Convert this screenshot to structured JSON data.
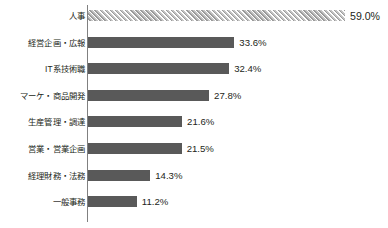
{
  "chart_data": {
    "type": "bar",
    "orientation": "horizontal",
    "title": "",
    "subtitle": "",
    "xlabel": "",
    "ylabel": "",
    "xlim": [
      0,
      59.0
    ],
    "grid": false,
    "legend": null,
    "categories": [
      "人事",
      "経営企画・広報",
      "IT系技術職",
      "マーケ・商品開発",
      "生産管理・調達",
      "営業・営業企画",
      "経理財務・法務",
      "一般事務"
    ],
    "values": [
      59.0,
      33.6,
      32.4,
      27.8,
      21.6,
      21.5,
      14.3,
      11.2
    ],
    "value_labels": [
      "59.0%",
      "33.6%",
      "32.4%",
      "27.8%",
      "21.6%",
      "21.5%",
      "14.3%",
      "11.2%"
    ],
    "bar_styles": [
      "hatched",
      "solid",
      "solid",
      "solid",
      "solid",
      "solid",
      "solid",
      "solid"
    ],
    "colors": {
      "bar_solid": "#595959",
      "bar_hatch_fill": "#c9c9c9",
      "bar_hatch_line": "#9a9a9a",
      "axis": "#808080",
      "text": "#231f20",
      "background": "#ffffff"
    }
  }
}
